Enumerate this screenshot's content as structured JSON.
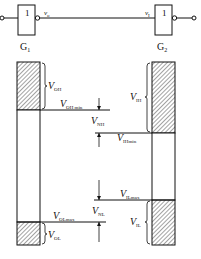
{
  "gates": [
    {
      "id": "G1",
      "label": "G",
      "sub": "1",
      "symbol": "1"
    },
    {
      "id": "G2",
      "label": "G",
      "sub": "2",
      "symbol": "1"
    }
  ],
  "signals": {
    "output": {
      "main": "v",
      "sub": "o"
    },
    "input": {
      "main": "v",
      "sub": "I"
    }
  },
  "left_bar": {
    "labels": {
      "voh": {
        "main": "V",
        "sub": "OH"
      },
      "voh_min": {
        "main": "V",
        "sub": "OH min"
      },
      "vol_max": {
        "main": "V",
        "sub": "OLmax"
      },
      "vol": {
        "main": "V",
        "sub": "OL"
      }
    }
  },
  "right_bar": {
    "labels": {
      "vih": {
        "main": "V",
        "sub": "IH"
      },
      "vih_min": {
        "main": "V",
        "sub": "IHmin"
      },
      "vil_max": {
        "main": "V",
        "sub": "ILmax"
      },
      "vil": {
        "main": "V",
        "sub": "IL"
      }
    }
  },
  "noise_margins": {
    "vnh": {
      "main": "V",
      "sub": "NH"
    },
    "vnl": {
      "main": "V",
      "sub": "NL"
    }
  },
  "colors": {
    "stroke": "#111111",
    "hatch": "#333333",
    "background": "#ffffff"
  }
}
